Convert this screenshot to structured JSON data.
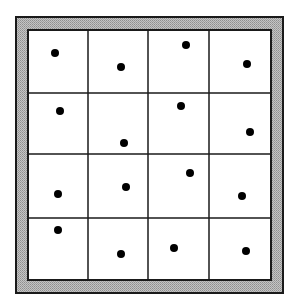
{
  "diagram": {
    "type": "stratified-sampling-grid",
    "grid": {
      "rows": 4,
      "cols": 4
    },
    "colors": {
      "background": "#ffffff",
      "frame_fill": "#b4b4b4",
      "line": "#1a1a1a",
      "dot": "#000000"
    },
    "frame": {
      "outer": [
        16,
        17,
        283,
        293
      ],
      "inner": [
        28,
        30,
        271,
        280
      ]
    },
    "col_edges": [
      28,
      88,
      148,
      209,
      271
    ],
    "row_edges": [
      30,
      93,
      154,
      218,
      280
    ],
    "dots": [
      {
        "row": 0,
        "col": 0,
        "x": 55,
        "y": 53
      },
      {
        "row": 0,
        "col": 1,
        "x": 121,
        "y": 67
      },
      {
        "row": 0,
        "col": 2,
        "x": 186,
        "y": 45
      },
      {
        "row": 0,
        "col": 3,
        "x": 247,
        "y": 64
      },
      {
        "row": 1,
        "col": 0,
        "x": 60,
        "y": 111
      },
      {
        "row": 1,
        "col": 1,
        "x": 124,
        "y": 143
      },
      {
        "row": 1,
        "col": 2,
        "x": 181,
        "y": 106
      },
      {
        "row": 1,
        "col": 3,
        "x": 250,
        "y": 132
      },
      {
        "row": 2,
        "col": 0,
        "x": 58,
        "y": 194
      },
      {
        "row": 2,
        "col": 1,
        "x": 126,
        "y": 187
      },
      {
        "row": 2,
        "col": 2,
        "x": 190,
        "y": 173
      },
      {
        "row": 2,
        "col": 3,
        "x": 242,
        "y": 196
      },
      {
        "row": 3,
        "col": 0,
        "x": 58,
        "y": 230
      },
      {
        "row": 3,
        "col": 1,
        "x": 121,
        "y": 254
      },
      {
        "row": 3,
        "col": 2,
        "x": 174,
        "y": 248
      },
      {
        "row": 3,
        "col": 3,
        "x": 246,
        "y": 251
      }
    ],
    "dot_radius": 4
  }
}
